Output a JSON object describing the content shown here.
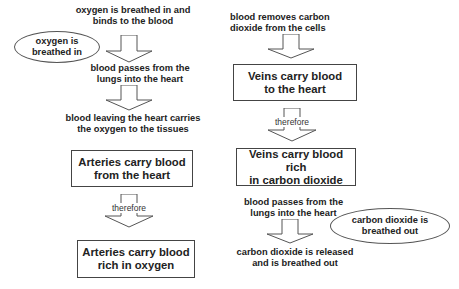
{
  "diagram": {
    "left": {
      "step1": "oxygen is breathed in and binds to the blood",
      "step1_lines": [
        "oxygen is breathed in and",
        "binds to the blood"
      ],
      "ellipse": [
        "oxygen is",
        "breathed in"
      ],
      "step2_lines": [
        "blood passes from the",
        "lungs into the heart"
      ],
      "step3_lines": [
        "blood leaving the heart carries",
        "the oxygen to the tissues"
      ],
      "box1_lines": [
        "Arteries carry blood",
        "from the heart"
      ],
      "connector": "therefore",
      "box2_lines": [
        "Arteries carry blood",
        "rich in oxygen"
      ]
    },
    "right": {
      "step1_lines": [
        "blood removes carbon",
        "dioxide from the cells"
      ],
      "box1_lines": [
        "Veins carry blood",
        "to the heart"
      ],
      "connector": "therefore",
      "box2_lines": [
        "Veins carry blood rich",
        "in carbon dioxide"
      ],
      "step2_lines": [
        "blood passes from the",
        "lungs into the heart"
      ],
      "ellipse": [
        "carbon dioxide is",
        "breathed out"
      ],
      "step3_lines": [
        "carbon dioxide is released",
        "and is breathed out"
      ]
    },
    "colors": {
      "line": "#444444",
      "text": "#222222",
      "background": "#ffffff"
    }
  }
}
